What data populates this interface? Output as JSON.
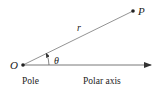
{
  "diagram": {
    "points": {
      "origin": {
        "label": "O",
        "x": 23,
        "y": 65
      },
      "point": {
        "label": "P",
        "x": 133,
        "y": 11
      }
    },
    "labels": {
      "radius": "r",
      "angle": "θ",
      "pole": "Pole",
      "axis": "Polar axis"
    },
    "colors": {
      "line": "#555555",
      "text": "#222222"
    }
  }
}
